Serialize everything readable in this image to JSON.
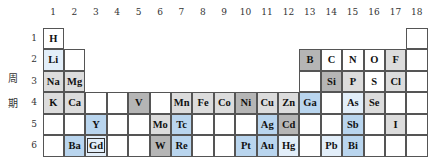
{
  "title_vertical": [
    "周",
    "期"
  ],
  "groups": [
    "1",
    "2",
    "3",
    "4",
    "5",
    "6",
    "7",
    "8",
    "9",
    "10",
    "11",
    "12",
    "13",
    "14",
    "15",
    "16",
    "17",
    "18"
  ],
  "periods": [
    "1",
    "2",
    "3",
    "4",
    "5",
    "6"
  ],
  "colors": {
    "white": "#ffffff",
    "gray": "#dcdcdc",
    "dgray": "#b5b5b5",
    "blue": "#b9d5ee",
    "lblue": "#e2eef9",
    "border": "#555555"
  },
  "cells": [
    {
      "period": 1,
      "group": 1,
      "symbol": "H",
      "shade": "white"
    },
    {
      "period": 1,
      "group": 18,
      "symbol": "",
      "shade": "white"
    },
    {
      "period": 2,
      "group": 1,
      "symbol": "Li",
      "shade": "lblue"
    },
    {
      "period": 2,
      "group": 2,
      "symbol": "",
      "shade": "white"
    },
    {
      "period": 2,
      "group": 13,
      "symbol": "B",
      "shade": "dgray"
    },
    {
      "period": 2,
      "group": 14,
      "symbol": "C",
      "shade": "white"
    },
    {
      "period": 2,
      "group": 15,
      "symbol": "N",
      "shade": "white"
    },
    {
      "period": 2,
      "group": 16,
      "symbol": "O",
      "shade": "white"
    },
    {
      "period": 2,
      "group": 17,
      "symbol": "F",
      "shade": "gray"
    },
    {
      "period": 2,
      "group": 18,
      "symbol": "",
      "shade": "white"
    },
    {
      "period": 3,
      "group": 1,
      "symbol": "Na",
      "shade": "gray"
    },
    {
      "period": 3,
      "group": 2,
      "symbol": "Mg",
      "shade": "gray"
    },
    {
      "period": 3,
      "group": 13,
      "symbol": "",
      "shade": "white"
    },
    {
      "period": 3,
      "group": 14,
      "symbol": "Si",
      "shade": "dgray"
    },
    {
      "period": 3,
      "group": 15,
      "symbol": "P",
      "shade": "gray"
    },
    {
      "period": 3,
      "group": 16,
      "symbol": "S",
      "shade": "white"
    },
    {
      "period": 3,
      "group": 17,
      "symbol": "Cl",
      "shade": "gray"
    },
    {
      "period": 3,
      "group": 18,
      "symbol": "",
      "shade": "white"
    },
    {
      "period": 4,
      "group": 1,
      "symbol": "K",
      "shade": "gray"
    },
    {
      "period": 4,
      "group": 2,
      "symbol": "Ca",
      "shade": "gray"
    },
    {
      "period": 4,
      "group": 3,
      "symbol": "",
      "shade": "white"
    },
    {
      "period": 4,
      "group": 4,
      "symbol": "",
      "shade": "white"
    },
    {
      "period": 4,
      "group": 5,
      "symbol": "V",
      "shade": "dgray"
    },
    {
      "period": 4,
      "group": 6,
      "symbol": "",
      "shade": "white"
    },
    {
      "period": 4,
      "group": 7,
      "symbol": "Mn",
      "shade": "gray"
    },
    {
      "period": 4,
      "group": 8,
      "symbol": "Fe",
      "shade": "gray"
    },
    {
      "period": 4,
      "group": 9,
      "symbol": "Co",
      "shade": "gray"
    },
    {
      "period": 4,
      "group": 10,
      "symbol": "Ni",
      "shade": "dgray"
    },
    {
      "period": 4,
      "group": 11,
      "symbol": "Cu",
      "shade": "gray"
    },
    {
      "period": 4,
      "group": 12,
      "symbol": "Zn",
      "shade": "gray"
    },
    {
      "period": 4,
      "group": 13,
      "symbol": "Ga",
      "shade": "blue"
    },
    {
      "period": 4,
      "group": 14,
      "symbol": "",
      "shade": "white"
    },
    {
      "period": 4,
      "group": 15,
      "symbol": "As",
      "shade": "lblue"
    },
    {
      "period": 4,
      "group": 16,
      "symbol": "Se",
      "shade": "gray"
    },
    {
      "period": 4,
      "group": 17,
      "symbol": "",
      "shade": "white"
    },
    {
      "period": 4,
      "group": 18,
      "symbol": "",
      "shade": "white"
    },
    {
      "period": 5,
      "group": 1,
      "symbol": "",
      "shade": "white"
    },
    {
      "period": 5,
      "group": 2,
      "symbol": "",
      "shade": "white"
    },
    {
      "period": 5,
      "group": 3,
      "symbol": "Y",
      "shade": "blue"
    },
    {
      "period": 5,
      "group": 4,
      "symbol": "",
      "shade": "white"
    },
    {
      "period": 5,
      "group": 5,
      "symbol": "",
      "shade": "white"
    },
    {
      "period": 5,
      "group": 6,
      "symbol": "Mo",
      "shade": "gray"
    },
    {
      "period": 5,
      "group": 7,
      "symbol": "Tc",
      "shade": "blue"
    },
    {
      "period": 5,
      "group": 8,
      "symbol": "",
      "shade": "white"
    },
    {
      "period": 5,
      "group": 9,
      "symbol": "",
      "shade": "white"
    },
    {
      "period": 5,
      "group": 10,
      "symbol": "",
      "shade": "white"
    },
    {
      "period": 5,
      "group": 11,
      "symbol": "Ag",
      "shade": "blue"
    },
    {
      "period": 5,
      "group": 12,
      "symbol": "Cd",
      "shade": "dgray"
    },
    {
      "period": 5,
      "group": 13,
      "symbol": "",
      "shade": "white"
    },
    {
      "period": 5,
      "group": 14,
      "symbol": "",
      "shade": "white"
    },
    {
      "period": 5,
      "group": 15,
      "symbol": "Sb",
      "shade": "blue"
    },
    {
      "period": 5,
      "group": 16,
      "symbol": "",
      "shade": "white"
    },
    {
      "period": 5,
      "group": 17,
      "symbol": "I",
      "shade": "gray"
    },
    {
      "period": 5,
      "group": 18,
      "symbol": "",
      "shade": "white"
    },
    {
      "period": 6,
      "group": 1,
      "symbol": "",
      "shade": "white"
    },
    {
      "period": 6,
      "group": 2,
      "symbol": "Ba",
      "shade": "blue"
    },
    {
      "period": 6,
      "group": 3,
      "symbol": "Gd",
      "shade": "lblue",
      "boxed": true
    },
    {
      "period": 6,
      "group": 4,
      "symbol": "",
      "shade": "white"
    },
    {
      "period": 6,
      "group": 5,
      "symbol": "",
      "shade": "white"
    },
    {
      "period": 6,
      "group": 6,
      "symbol": "W",
      "shade": "dgray"
    },
    {
      "period": 6,
      "group": 7,
      "symbol": "Re",
      "shade": "blue"
    },
    {
      "period": 6,
      "group": 8,
      "symbol": "",
      "shade": "white"
    },
    {
      "period": 6,
      "group": 9,
      "symbol": "",
      "shade": "white"
    },
    {
      "period": 6,
      "group": 10,
      "symbol": "Pt",
      "shade": "blue"
    },
    {
      "period": 6,
      "group": 11,
      "symbol": "Au",
      "shade": "blue"
    },
    {
      "period": 6,
      "group": 12,
      "symbol": "Hg",
      "shade": "lblue"
    },
    {
      "period": 6,
      "group": 13,
      "symbol": "",
      "shade": "white"
    },
    {
      "period": 6,
      "group": 14,
      "symbol": "Pb",
      "shade": "lblue"
    },
    {
      "period": 6,
      "group": 15,
      "symbol": "Bi",
      "shade": "blue"
    },
    {
      "period": 6,
      "group": 16,
      "symbol": "",
      "shade": "white"
    },
    {
      "period": 6,
      "group": 17,
      "symbol": "",
      "shade": "white"
    },
    {
      "period": 6,
      "group": 18,
      "symbol": "",
      "shade": "white"
    }
  ]
}
